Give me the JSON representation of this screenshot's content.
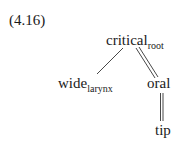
{
  "example": {
    "number": "(4.16)"
  },
  "tree": {
    "root": {
      "label": "critical",
      "subscript": "root"
    },
    "left_child": {
      "label": "wide",
      "subscript": "larynx",
      "link": "single"
    },
    "right_child": {
      "label": "oral",
      "link": "double"
    },
    "grandchild": {
      "label": "tip",
      "parent": "oral",
      "link": "double"
    }
  }
}
